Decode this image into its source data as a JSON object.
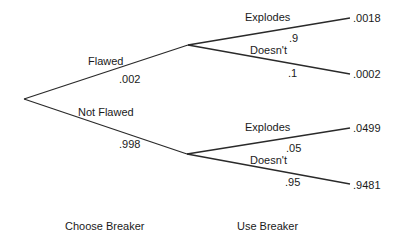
{
  "tree": {
    "root": {
      "label": ""
    },
    "branches": [
      {
        "label": "Flawed",
        "probability": ".002",
        "children": [
          {
            "label": "Explodes",
            "probability": ".9",
            "outcome": ".0018"
          },
          {
            "label": "Doesn't",
            "probability": ".1",
            "outcome": ".0002"
          }
        ]
      },
      {
        "label": "Not Flawed",
        "probability": ".998",
        "children": [
          {
            "label": "Explodes",
            "probability": ".05",
            "outcome": ".0499"
          },
          {
            "label": "Doesn't",
            "probability": ".95",
            "outcome": ".9481"
          }
        ]
      }
    ]
  },
  "stages": [
    {
      "label": "Choose Breaker"
    },
    {
      "label": "Use Breaker"
    }
  ],
  "colors": {
    "line": "#2a2a2a",
    "text": "#1a1a1a",
    "background": "#ffffff"
  }
}
